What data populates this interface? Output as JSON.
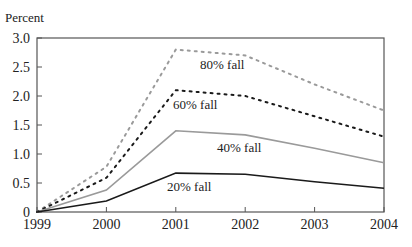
{
  "chart_data": {
    "type": "line",
    "title": "",
    "xlabel": "",
    "ylabel": "Percent",
    "x": [
      1999,
      2000,
      2001,
      2002,
      2003,
      2004
    ],
    "ylim": [
      0,
      3.0
    ],
    "xlim": [
      1999,
      2004
    ],
    "yticks": [
      "0",
      "0.5",
      "1.0",
      "1.5",
      "2.0",
      "2.5",
      "3.0"
    ],
    "xticks": [
      "1999",
      "2000",
      "2001",
      "2002",
      "2003",
      "2004"
    ],
    "grid": false,
    "legend": "inline labels",
    "series": [
      {
        "name": "80% fall",
        "style": "dotted",
        "color": "#9a9a9a",
        "values": [
          0,
          0.78,
          2.8,
          2.7,
          2.2,
          1.75
        ]
      },
      {
        "name": "60% fall",
        "style": "dotted",
        "color": "#1a1a1a",
        "values": [
          0,
          0.59,
          2.1,
          2.0,
          1.65,
          1.3
        ]
      },
      {
        "name": "40% fall",
        "style": "solid",
        "color": "#9a9a9a",
        "values": [
          0,
          0.38,
          1.4,
          1.33,
          1.1,
          0.85
        ]
      },
      {
        "name": "20% fall",
        "style": "solid",
        "color": "#1a1a1a",
        "values": [
          0,
          0.19,
          0.67,
          0.65,
          0.52,
          0.41
        ]
      }
    ]
  },
  "labels": {
    "ylabel": "Percent",
    "series": [
      "80% fall",
      "60% fall",
      "40% fall",
      "20% fall"
    ]
  }
}
